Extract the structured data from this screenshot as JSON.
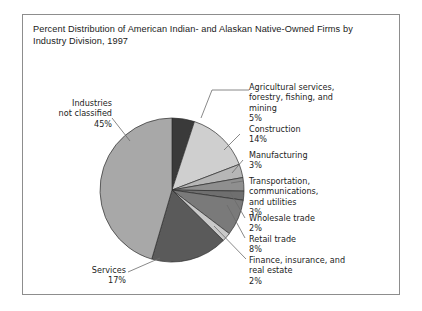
{
  "figure": {
    "title": "Percent Distribution of American Indian- and Alaskan Native-Owned Firms by Industry Division, 1997",
    "border_color": "#8d8d8d",
    "background": "#ffffff"
  },
  "chart_data": {
    "type": "pie",
    "title": "Percent Distribution of American Indian- and Alaskan Native-Owned Firms by Industry Division, 1997",
    "xlabel": "",
    "ylabel": "",
    "units": "percent",
    "start_angle_deg": 0,
    "direction": "clockwise",
    "legend": "callout-labels",
    "grid": false,
    "categories": [
      "Agricultural services, forestry, fishing, and mining",
      "Construction",
      "Manufacturing",
      "Transportation, communications, and utilities",
      "Wholesale trade",
      "Retail trade",
      "Finance, insurance, and real estate",
      "Services",
      "Industries not classified"
    ],
    "values": [
      5,
      14,
      3,
      3,
      2,
      8,
      2,
      17,
      45
    ],
    "colors": [
      "#3a3a3a",
      "#cfcfcf",
      "#b6b6b6",
      "#8f8f8f",
      "#6f6f6f",
      "#7a7a7a",
      "#c9c9c9",
      "#5a5a5a",
      "#a8a8a8"
    ],
    "slices": [
      {
        "label": "Agricultural services, forestry, fishing, and mining",
        "value": 5,
        "display": "5%",
        "color": "#3a3a3a"
      },
      {
        "label": "Construction",
        "value": 14,
        "display": "14%",
        "color": "#cfcfcf"
      },
      {
        "label": "Manufacturing",
        "value": 3,
        "display": "3%",
        "color": "#b6b6b6"
      },
      {
        "label": "Transportation, communications, and utilities",
        "value": 3,
        "display": "3%",
        "color": "#8f8f8f"
      },
      {
        "label": "Wholesale trade",
        "value": 2,
        "display": "2%",
        "color": "#6f6f6f"
      },
      {
        "label": "Retail trade",
        "value": 8,
        "display": "8%",
        "color": "#7a7a7a"
      },
      {
        "label": "Finance, insurance, and real estate",
        "value": 2,
        "display": "2%",
        "color": "#c9c9c9"
      },
      {
        "label": "Services",
        "value": 17,
        "display": "17%",
        "color": "#5a5a5a"
      },
      {
        "label": "Industries not classified",
        "value": 45,
        "display": "45%",
        "color": "#a8a8a8"
      }
    ]
  },
  "callouts": {
    "agricultural": "Agricultural services,\nforestry, fishing, and\nmining\n5%",
    "construction": "Construction\n14%",
    "manufacturing": "Manufacturing\n3%",
    "transportation": "Transportation,\ncommunications,\nand utilities\n3%",
    "wholesale": "Wholesale trade\n2%",
    "retail": "Retail trade\n8%",
    "finance": "Finance, insurance, and\nreal estate\n2%",
    "services": "Services\n17%",
    "industries": "Industries\nnot classified\n45%"
  }
}
